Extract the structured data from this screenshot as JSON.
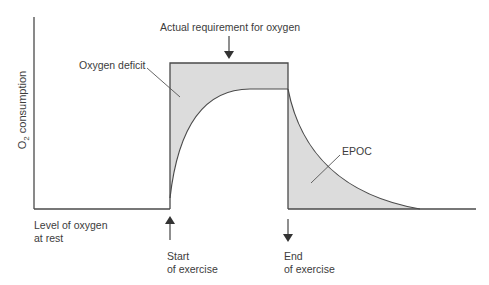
{
  "diagram": {
    "y_axis_label": "O",
    "y_axis_label_sub": "2",
    "y_axis_label_rest": " consumption",
    "labels": {
      "requirement": "Actual requirement for oxygen",
      "deficit": "Oxygen deficit",
      "epoc": "EPOC",
      "rest_line1": "Level of oxygen",
      "rest_line2": "at rest",
      "start_line1": "Start",
      "start_line2": "of exercise",
      "end_line1": "End",
      "end_line2": "of exercise"
    },
    "colors": {
      "line": "#4a4a4a",
      "fill": "#dcdcdc",
      "text": "#3c3c3c"
    }
  }
}
